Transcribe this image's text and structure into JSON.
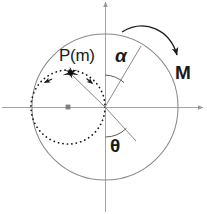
{
  "figure": {
    "title_strip": "",
    "background_color": "#ffffff",
    "width": 207,
    "height": 214,
    "labels": {
      "point": "P(m)",
      "alpha": "α",
      "moment": "M",
      "theta": "θ"
    },
    "colors": {
      "axis": "#9a9a9a",
      "circle": "#8a8a8a",
      "dotted_circle": "#1a1a1a",
      "radius_line": "#8a8a8a",
      "arc_arrow": "#1a1a1a",
      "point_marker": "#111111",
      "text": "#1a1a1a"
    },
    "geometry": {
      "center": {
        "x": 105,
        "y": 107
      },
      "main_circle_radius": 73,
      "dotted_circle": {
        "cx": 68,
        "cy": 107,
        "r": 37
      },
      "point_p": {
        "x": 70,
        "y": 73
      },
      "alpha_line_end": {
        "x": 141,
        "y": 46
      },
      "theta_line_end": {
        "x": 136,
        "y": 141
      },
      "alpha_arc_radius": 32,
      "theta_arc_radius": 30,
      "rotation_direction": "clockwise"
    }
  }
}
